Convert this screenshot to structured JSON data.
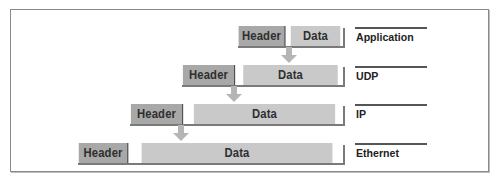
{
  "figure": {
    "layers": [
      {
        "name": "Application",
        "header_label": "Header",
        "data_label": "Data"
      },
      {
        "name": "UDP",
        "header_label": "Header",
        "data_label": "Data"
      },
      {
        "name": "IP",
        "header_label": "Header",
        "data_label": "Data"
      },
      {
        "name": "Ethernet",
        "header_label": "Header",
        "data_label": "Data"
      }
    ],
    "colors": {
      "header_fill": "#a8a8a8",
      "data_fill": "#c9c9c9",
      "arrow_fill": "#b5b5b5",
      "text": "#2f2f2f",
      "border": "#8a8a8a"
    }
  }
}
